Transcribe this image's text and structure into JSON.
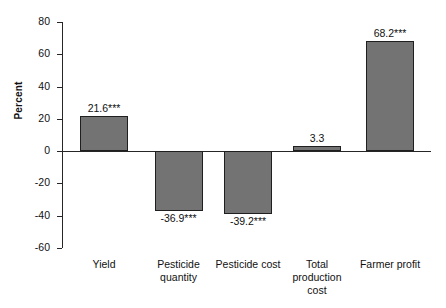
{
  "chart_data": {
    "type": "bar",
    "title": "",
    "subtitle": "",
    "xlabel": "",
    "ylabel": "Percent",
    "categories": [
      "Yield",
      "Pesticide\nquantity",
      "Pesticide cost",
      "Total\nproduction\ncost",
      "Farmer profit"
    ],
    "values": [
      21.6,
      -36.9,
      -39.2,
      3.3,
      68.2
    ],
    "point_labels": [
      "21.6***",
      "-36.9***",
      "-39.2***",
      "3.3",
      "68.2***"
    ],
    "ylim": [
      -60,
      80
    ],
    "yticks": [
      80,
      60,
      40,
      20,
      0,
      -20,
      -40,
      -60
    ],
    "ytick_labels": [
      "80",
      "60",
      "40",
      "20",
      "0",
      "-20",
      "-40",
      "-60"
    ],
    "grid": false,
    "legend": null,
    "bar_color": "#737373",
    "bar_edge_color": "#1f1f1f",
    "axis_color": "#262626",
    "significance_note": "*** denotes statistical significance"
  }
}
